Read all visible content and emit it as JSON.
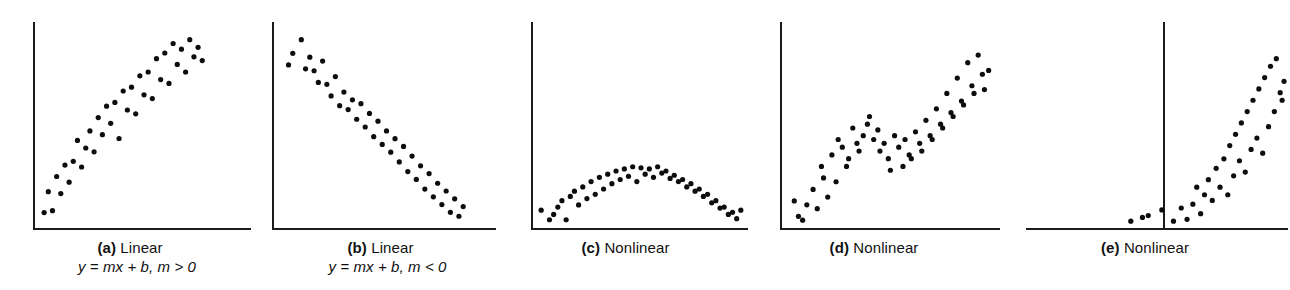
{
  "figure": {
    "background_color": "#ffffff",
    "dot_color": "#0d0d0d",
    "axis_color": "#1b1b1b",
    "panel_count": 5
  },
  "panels": [
    {
      "id": "a",
      "label": "(a)",
      "name": "Linear",
      "equation_plain": "y = mx + b, m > 0",
      "equation_parts": {
        "lhs": "y = mx + b,",
        "rhs": "m > 0"
      },
      "has_equation": true,
      "description": "Positive linear relationship, points rise from lower-left to upper-right"
    },
    {
      "id": "b",
      "label": "(b)",
      "name": "Linear",
      "equation_plain": "y = mx + b, m < 0",
      "equation_parts": {
        "lhs": "y = mx + b,",
        "rhs": "m < 0"
      },
      "has_equation": true,
      "description": "Negative linear relationship, points fall from upper-left to lower-right"
    },
    {
      "id": "c",
      "label": "(c)",
      "name": "Nonlinear",
      "equation_plain": "",
      "has_equation": false,
      "description": "Inverted U shaped quadratic arch, rises to a peak then falls"
    },
    {
      "id": "d",
      "label": "(d)",
      "name": "Nonlinear",
      "equation_plain": "",
      "has_equation": false,
      "description": "Wavy ascending curve, rises, plateaus with a dip, then rises steeply"
    },
    {
      "id": "e",
      "label": "(e)",
      "name": "Nonlinear",
      "equation_plain": "",
      "has_equation": false,
      "description": "Exponential curve, flat near origin then rising sharply; vertical axis drawn mid-plot"
    }
  ],
  "chart_data": [
    {
      "type": "scatter",
      "panel": "a",
      "title": "(a) Linear  y = mx + b, m > 0",
      "xlabel": "",
      "ylabel": "",
      "grid": false,
      "legend": "none",
      "xlim": [
        0,
        100
      ],
      "ylim": [
        0,
        100
      ],
      "points": [
        [
          2,
          6
        ],
        [
          6,
          7
        ],
        [
          4,
          17
        ],
        [
          10,
          16
        ],
        [
          8,
          25
        ],
        [
          14,
          22
        ],
        [
          16,
          33
        ],
        [
          12,
          31
        ],
        [
          20,
          30
        ],
        [
          22,
          40
        ],
        [
          18,
          44
        ],
        [
          26,
          38
        ],
        [
          24,
          49
        ],
        [
          30,
          47
        ],
        [
          28,
          56
        ],
        [
          34,
          53
        ],
        [
          32,
          62
        ],
        [
          38,
          45
        ],
        [
          36,
          64
        ],
        [
          42,
          60
        ],
        [
          40,
          70
        ],
        [
          46,
          58
        ],
        [
          44,
          72
        ],
        [
          50,
          68
        ],
        [
          48,
          78
        ],
        [
          54,
          66
        ],
        [
          52,
          80
        ],
        [
          58,
          76
        ],
        [
          56,
          87
        ],
        [
          62,
          74
        ],
        [
          60,
          90
        ],
        [
          66,
          84
        ],
        [
          64,
          95
        ],
        [
          70,
          80
        ],
        [
          68,
          92
        ],
        [
          74,
          88
        ],
        [
          72,
          97
        ],
        [
          78,
          86
        ],
        [
          76,
          93
        ]
      ]
    },
    {
      "type": "scatter",
      "panel": "b",
      "title": "(b) Linear  y = mx + b, m < 0",
      "xlabel": "",
      "ylabel": "",
      "grid": false,
      "legend": "none",
      "xlim": [
        0,
        100
      ],
      "ylim": [
        0,
        100
      ],
      "points": [
        [
          6,
          88
        ],
        [
          10,
          95
        ],
        [
          4,
          82
        ],
        [
          12,
          80
        ],
        [
          16,
          79
        ],
        [
          14,
          86
        ],
        [
          20,
          84
        ],
        [
          18,
          73
        ],
        [
          22,
          72
        ],
        [
          26,
          76
        ],
        [
          24,
          66
        ],
        [
          30,
          68
        ],
        [
          28,
          61
        ],
        [
          34,
          64
        ],
        [
          32,
          59
        ],
        [
          38,
          62
        ],
        [
          36,
          54
        ],
        [
          42,
          57
        ],
        [
          40,
          50
        ],
        [
          46,
          53
        ],
        [
          44,
          45
        ],
        [
          50,
          48
        ],
        [
          48,
          41
        ],
        [
          54,
          44
        ],
        [
          52,
          37
        ],
        [
          58,
          40
        ],
        [
          56,
          32
        ],
        [
          62,
          35
        ],
        [
          60,
          27
        ],
        [
          66,
          30
        ],
        [
          64,
          23
        ],
        [
          70,
          26
        ],
        [
          68,
          18
        ],
        [
          74,
          21
        ],
        [
          72,
          14
        ],
        [
          78,
          17
        ],
        [
          76,
          10
        ],
        [
          82,
          13
        ],
        [
          80,
          6
        ],
        [
          86,
          9
        ],
        [
          84,
          4
        ]
      ]
    },
    {
      "type": "scatter",
      "panel": "c",
      "title": "(c) Nonlinear",
      "xlabel": "",
      "ylabel": "",
      "grid": false,
      "legend": "none",
      "xlim": [
        0,
        100
      ],
      "ylim": [
        0,
        100
      ],
      "points": [
        [
          2,
          13
        ],
        [
          6,
          4
        ],
        [
          10,
          16
        ],
        [
          8,
          9
        ],
        [
          14,
          4
        ],
        [
          12,
          22
        ],
        [
          16,
          26
        ],
        [
          20,
          18
        ],
        [
          18,
          31
        ],
        [
          24,
          24
        ],
        [
          22,
          35
        ],
        [
          28,
          28
        ],
        [
          26,
          40
        ],
        [
          32,
          33
        ],
        [
          30,
          44
        ],
        [
          36,
          38
        ],
        [
          34,
          47
        ],
        [
          40,
          42
        ],
        [
          38,
          50
        ],
        [
          44,
          45
        ],
        [
          42,
          52
        ],
        [
          48,
          40
        ],
        [
          46,
          54
        ],
        [
          52,
          47
        ],
        [
          50,
          53
        ],
        [
          56,
          44
        ],
        [
          54,
          52
        ],
        [
          60,
          48
        ],
        [
          58,
          54
        ],
        [
          64,
          43
        ],
        [
          62,
          50
        ],
        [
          68,
          40
        ],
        [
          66,
          46
        ],
        [
          72,
          35
        ],
        [
          70,
          42
        ],
        [
          76,
          31
        ],
        [
          74,
          38
        ],
        [
          80,
          26
        ],
        [
          78,
          33
        ],
        [
          84,
          20
        ],
        [
          82,
          28
        ],
        [
          88,
          15
        ],
        [
          86,
          22
        ],
        [
          92,
          9
        ],
        [
          90,
          16
        ],
        [
          96,
          5
        ],
        [
          94,
          11
        ],
        [
          98,
          13
        ]
      ]
    },
    {
      "type": "scatter",
      "panel": "d",
      "title": "(d) Nonlinear",
      "xlabel": "",
      "ylabel": "",
      "grid": false,
      "legend": "none",
      "xlim": [
        0,
        100
      ],
      "ylim": [
        0,
        100
      ],
      "points": [
        [
          3,
          12
        ],
        [
          5,
          4
        ],
        [
          9,
          10
        ],
        [
          7,
          2
        ],
        [
          12,
          18
        ],
        [
          14,
          8
        ],
        [
          17,
          24
        ],
        [
          19,
          14
        ],
        [
          16,
          30
        ],
        [
          21,
          36
        ],
        [
          23,
          22
        ],
        [
          26,
          40
        ],
        [
          24,
          44
        ],
        [
          28,
          30
        ],
        [
          31,
          50
        ],
        [
          29,
          34
        ],
        [
          33,
          42
        ],
        [
          36,
          46
        ],
        [
          34,
          38
        ],
        [
          38,
          52
        ],
        [
          41,
          44
        ],
        [
          43,
          49
        ],
        [
          39,
          56
        ],
        [
          46,
          42
        ],
        [
          48,
          34
        ],
        [
          44,
          38
        ],
        [
          51,
          46
        ],
        [
          53,
          40
        ],
        [
          49,
          28
        ],
        [
          56,
          44
        ],
        [
          58,
          36
        ],
        [
          55,
          30
        ],
        [
          61,
          48
        ],
        [
          63,
          42
        ],
        [
          59,
          34
        ],
        [
          66,
          54
        ],
        [
          68,
          46
        ],
        [
          64,
          38
        ],
        [
          71,
          60
        ],
        [
          73,
          52
        ],
        [
          69,
          44
        ],
        [
          76,
          68
        ],
        [
          78,
          58
        ],
        [
          74,
          50
        ],
        [
          81,
          76
        ],
        [
          83,
          64
        ],
        [
          79,
          56
        ],
        [
          86,
          84
        ],
        [
          88,
          72
        ],
        [
          84,
          62
        ],
        [
          91,
          88
        ],
        [
          93,
          78
        ],
        [
          89,
          68
        ],
        [
          96,
          80
        ],
        [
          94,
          70
        ]
      ]
    },
    {
      "type": "scatter",
      "panel": "e",
      "title": "(e) Nonlinear",
      "xlabel": "",
      "ylabel": "",
      "grid": false,
      "legend": "none",
      "xlim": [
        0,
        100
      ],
      "ylim": [
        0,
        100
      ],
      "y_axis_position_fraction": 0.47,
      "points": [
        [
          20,
          2
        ],
        [
          26,
          4
        ],
        [
          29,
          5
        ],
        [
          36,
          8
        ],
        [
          42,
          2
        ],
        [
          46,
          9
        ],
        [
          49,
          3
        ],
        [
          52,
          11
        ],
        [
          56,
          6
        ],
        [
          58,
          16
        ],
        [
          54,
          20
        ],
        [
          62,
          13
        ],
        [
          60,
          24
        ],
        [
          66,
          20
        ],
        [
          64,
          30
        ],
        [
          70,
          16
        ],
        [
          68,
          35
        ],
        [
          73,
          26
        ],
        [
          71,
          42
        ],
        [
          76,
          34
        ],
        [
          74,
          48
        ],
        [
          79,
          28
        ],
        [
          77,
          54
        ],
        [
          82,
          40
        ],
        [
          80,
          60
        ],
        [
          85,
          46
        ],
        [
          83,
          66
        ],
        [
          88,
          38
        ],
        [
          86,
          72
        ],
        [
          91,
          52
        ],
        [
          89,
          78
        ],
        [
          94,
          60
        ],
        [
          92,
          84
        ],
        [
          97,
          70
        ],
        [
          95,
          88
        ],
        [
          99,
          76
        ],
        [
          98,
          66
        ]
      ]
    }
  ]
}
